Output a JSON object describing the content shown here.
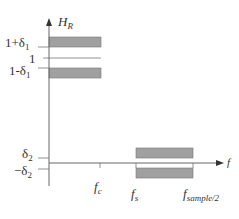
{
  "diagram": {
    "y_axis": {
      "label": "H",
      "label_sub": "R"
    },
    "x_axis": {
      "label": "f"
    },
    "y_ticks": [
      {
        "base": "1+δ",
        "sub": "1"
      },
      {
        "base": "1",
        "sub": ""
      },
      {
        "base": "1-δ",
        "sub": "1"
      },
      {
        "base": "δ",
        "sub": "2"
      },
      {
        "base": "−δ",
        "sub": "2"
      }
    ],
    "x_ticks": [
      {
        "base": "f",
        "sub": "c"
      },
      {
        "base": "f",
        "sub": "s"
      },
      {
        "base": "f",
        "sub": "sample/2"
      }
    ],
    "regions": [
      {
        "name": "passband-upper-tolerance",
        "from": "0",
        "to": "f_c",
        "level": "1+δ1"
      },
      {
        "name": "passband-lower-tolerance",
        "from": "0",
        "to": "f_c",
        "level": "1-δ1"
      },
      {
        "name": "stopband-upper-tolerance",
        "from": "f_s",
        "to": "f_sample/2",
        "level": "δ2"
      },
      {
        "name": "stopband-lower-tolerance",
        "from": "f_s",
        "to": "f_sample/2",
        "level": "−δ2"
      }
    ],
    "colors": {
      "band_fill": "#a0a0a0",
      "band_stroke": "#707070",
      "axis": "#666666"
    }
  }
}
